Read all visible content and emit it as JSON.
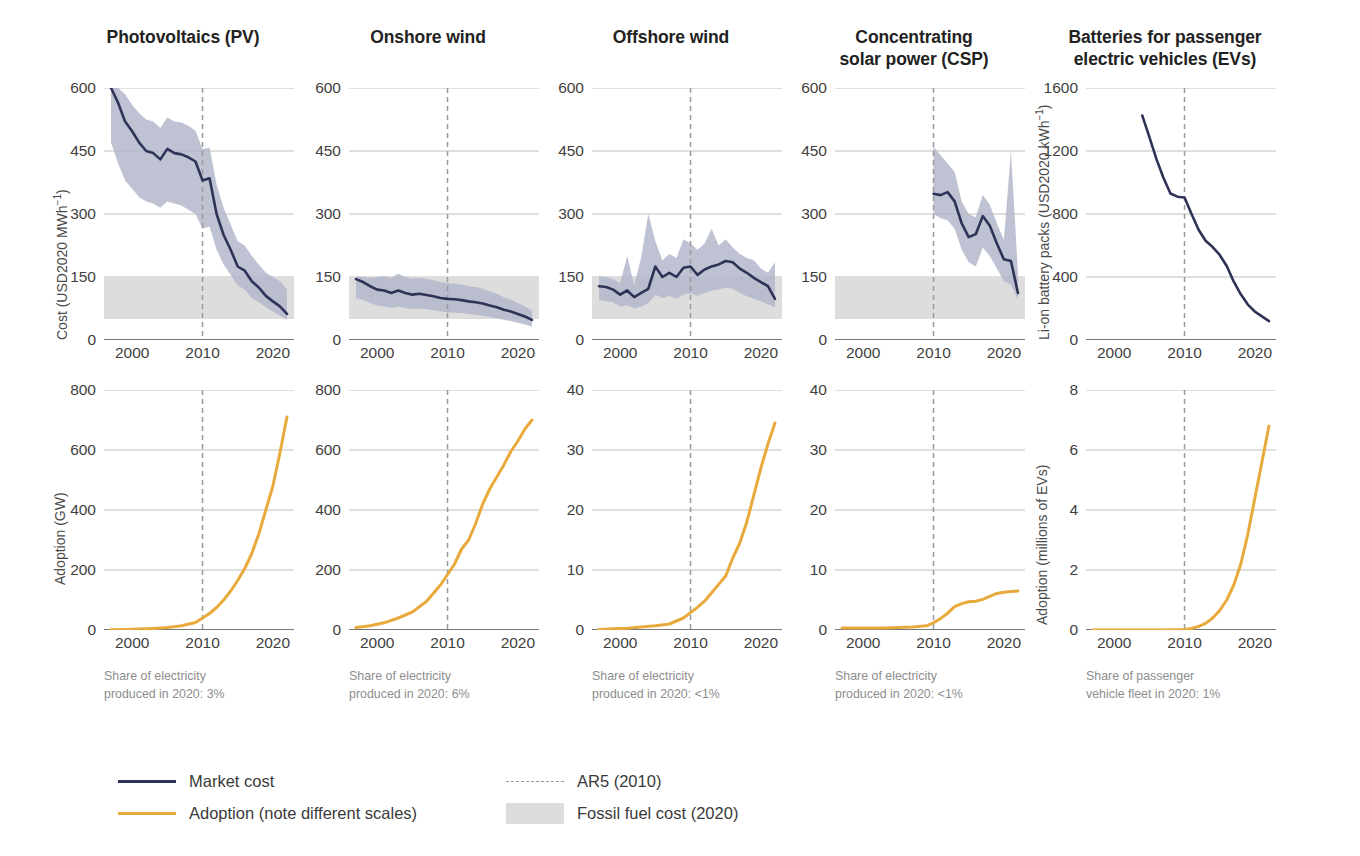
{
  "figure": {
    "legend": {
      "market_cost": "Market cost",
      "adoption": "Adoption (note different scales)",
      "ar5": "AR5 (2010)",
      "fossil": "Fossil fuel cost (2020)"
    },
    "colors": {
      "market_cost_line": "#2e3357",
      "adoption_line": "#e8aa3c",
      "uncertainty_band": "#b3b7cb",
      "fossil_band": "#dddddd",
      "ar5_dashed": "#9a9a9a",
      "axis": "#777777",
      "grid": "#b8b8b8"
    },
    "ar5_year": 2010
  },
  "panels": [
    {
      "id": "pv",
      "title": "Photovoltaics (PV)",
      "note_line1": "Share of electricity",
      "note_line2": "produced in 2020: 3%",
      "cost": {
        "ylabel_html": "Cost (USD2020 MWh<sup>−1</sup>)",
        "yticks": [
          0,
          150,
          300,
          450,
          600
        ],
        "ylim": [
          0,
          600
        ],
        "xlim": [
          1996,
          2023
        ],
        "xticks": [
          2000,
          2010,
          2020
        ],
        "fossil_band": [
          50,
          150
        ],
        "x": [
          1997,
          1998,
          1999,
          2000,
          2001,
          2002,
          2003,
          2004,
          2005,
          2006,
          2007,
          2008,
          2009,
          2010,
          2011,
          2012,
          2013,
          2014,
          2015,
          2016,
          2017,
          2018,
          2019,
          2020,
          2021,
          2022
        ],
        "y": [
          600,
          565,
          520,
          497,
          470,
          450,
          445,
          430,
          455,
          445,
          442,
          435,
          425,
          380,
          385,
          300,
          250,
          215,
          175,
          165,
          140,
          125,
          105,
          92,
          80,
          62
        ],
        "ylow": [
          470,
          420,
          380,
          360,
          340,
          330,
          325,
          315,
          330,
          325,
          320,
          310,
          300,
          265,
          270,
          215,
          180,
          155,
          130,
          120,
          100,
          90,
          78,
          68,
          58,
          48
        ],
        "yhigh": [
          600,
          600,
          585,
          560,
          540,
          525,
          520,
          505,
          530,
          520,
          518,
          510,
          498,
          455,
          458,
          370,
          315,
          275,
          235,
          225,
          200,
          180,
          160,
          150,
          140,
          120
        ]
      },
      "adoption": {
        "ylabel": "Adoption (GW)",
        "yticks": [
          0,
          200,
          400,
          600,
          800
        ],
        "ylim": [
          0,
          800
        ],
        "xlim": [
          1996,
          2023
        ],
        "xticks": [
          2000,
          2010,
          2020
        ],
        "x": [
          1997,
          1999,
          2001,
          2003,
          2005,
          2007,
          2009,
          2010,
          2011,
          2012,
          2013,
          2014,
          2015,
          2016,
          2017,
          2018,
          2019,
          2020,
          2021,
          2022
        ],
        "y": [
          1,
          2,
          3,
          5,
          8,
          14,
          25,
          40,
          55,
          75,
          100,
          130,
          165,
          205,
          255,
          320,
          400,
          480,
          590,
          710
        ]
      }
    },
    {
      "id": "onshore-wind",
      "title": "Onshore wind",
      "note_line1": "Share of electricity",
      "note_line2": "produced in 2020: 6%",
      "cost": {
        "yticks": [
          0,
          150,
          300,
          450,
          600
        ],
        "ylim": [
          0,
          600
        ],
        "xlim": [
          1996,
          2023
        ],
        "xticks": [
          2000,
          2010,
          2020
        ],
        "fossil_band": [
          50,
          150
        ],
        "x": [
          1997,
          1998,
          1999,
          2000,
          2001,
          2002,
          2003,
          2004,
          2005,
          2006,
          2007,
          2008,
          2009,
          2010,
          2011,
          2012,
          2013,
          2014,
          2015,
          2016,
          2017,
          2018,
          2019,
          2020,
          2021,
          2022
        ],
        "y": [
          145,
          138,
          128,
          120,
          118,
          112,
          118,
          112,
          108,
          110,
          107,
          104,
          100,
          98,
          97,
          95,
          92,
          90,
          87,
          82,
          78,
          72,
          68,
          62,
          56,
          48
        ],
        "ylow": [
          100,
          95,
          88,
          82,
          80,
          76,
          80,
          76,
          74,
          75,
          73,
          71,
          68,
          66,
          65,
          64,
          62,
          60,
          58,
          55,
          52,
          48,
          45,
          41,
          37,
          32
        ],
        "yhigh": [
          152,
          150,
          148,
          150,
          152,
          148,
          158,
          150,
          146,
          148,
          146,
          142,
          138,
          136,
          134,
          132,
          128,
          126,
          122,
          116,
          110,
          102,
          96,
          88,
          80,
          70
        ]
      },
      "adoption": {
        "yticks": [
          0,
          200,
          400,
          600,
          800
        ],
        "ylim": [
          0,
          800
        ],
        "xlim": [
          1996,
          2023
        ],
        "xticks": [
          2000,
          2010,
          2020
        ],
        "x": [
          1997,
          1999,
          2001,
          2003,
          2005,
          2007,
          2009,
          2010,
          2011,
          2012,
          2013,
          2014,
          2015,
          2016,
          2017,
          2018,
          2019,
          2020,
          2021,
          2022
        ],
        "y": [
          8,
          14,
          24,
          40,
          60,
          95,
          150,
          185,
          220,
          270,
          300,
          355,
          420,
          470,
          510,
          550,
          595,
          630,
          670,
          700
        ]
      }
    },
    {
      "id": "offshore-wind",
      "title": "Offshore wind",
      "note_line1": "Share of electricity",
      "note_line2": "produced in 2020: <1%",
      "cost": {
        "yticks": [
          0,
          150,
          300,
          450,
          600
        ],
        "ylim": [
          0,
          600
        ],
        "xlim": [
          1996,
          2023
        ],
        "xticks": [
          2000,
          2010,
          2020
        ],
        "fossil_band": [
          50,
          150
        ],
        "x": [
          1997,
          1998,
          1999,
          2000,
          2001,
          2002,
          2003,
          2004,
          2005,
          2006,
          2007,
          2008,
          2009,
          2010,
          2011,
          2012,
          2013,
          2014,
          2015,
          2016,
          2017,
          2018,
          2019,
          2020,
          2021,
          2022
        ],
        "y": [
          128,
          126,
          120,
          108,
          118,
          102,
          112,
          122,
          175,
          150,
          160,
          150,
          172,
          175,
          155,
          168,
          175,
          180,
          188,
          185,
          170,
          160,
          148,
          138,
          128,
          98
        ],
        "ylow": [
          95,
          92,
          90,
          80,
          82,
          75,
          80,
          88,
          108,
          100,
          105,
          98,
          108,
          112,
          105,
          112,
          118,
          120,
          125,
          122,
          112,
          104,
          98,
          92,
          85,
          78
        ],
        "yhigh": [
          152,
          150,
          145,
          135,
          200,
          130,
          198,
          300,
          235,
          190,
          205,
          195,
          240,
          230,
          215,
          230,
          265,
          225,
          240,
          220,
          205,
          195,
          190,
          170,
          160,
          185
        ]
      },
      "adoption": {
        "yticks": [
          0,
          10,
          20,
          30,
          40
        ],
        "ylim": [
          0,
          40
        ],
        "xlim": [
          1996,
          2023
        ],
        "xticks": [
          2000,
          2010,
          2020
        ],
        "x": [
          1997,
          1999,
          2001,
          2003,
          2005,
          2007,
          2009,
          2010,
          2011,
          2012,
          2013,
          2014,
          2015,
          2016,
          2017,
          2018,
          2019,
          2020,
          2021,
          2022
        ],
        "y": [
          0.1,
          0.2,
          0.3,
          0.5,
          0.7,
          1.0,
          2.0,
          2.9,
          3.8,
          4.8,
          6.2,
          7.6,
          9.0,
          12.0,
          14.5,
          18.0,
          22.5,
          27.0,
          31.0,
          34.5
        ]
      }
    },
    {
      "id": "csp",
      "title": "Concentrating\nsolar power (CSP)",
      "note_line1": "Share of electricity",
      "note_line2": "produced in 2020: <1%",
      "cost": {
        "yticks": [
          0,
          150,
          300,
          450,
          600
        ],
        "ylim": [
          0,
          600
        ],
        "xlim": [
          1996,
          2023
        ],
        "xticks": [
          2000,
          2010,
          2020
        ],
        "fossil_band": [
          50,
          150
        ],
        "x": [
          2010,
          2011,
          2012,
          2013,
          2014,
          2015,
          2016,
          2017,
          2018,
          2019,
          2020,
          2021,
          2022
        ],
        "y": [
          348,
          345,
          352,
          330,
          278,
          245,
          252,
          295,
          272,
          230,
          192,
          188,
          112
        ],
        "ylow": [
          300,
          290,
          285,
          265,
          215,
          185,
          175,
          220,
          200,
          170,
          140,
          132,
          95
        ],
        "yhigh": [
          460,
          440,
          420,
          400,
          330,
          300,
          292,
          345,
          322,
          278,
          238,
          450,
          160
        ]
      },
      "adoption": {
        "yticks": [
          0,
          10,
          20,
          30,
          40
        ],
        "ylim": [
          0,
          40
        ],
        "xlim": [
          1996,
          2023
        ],
        "xticks": [
          2000,
          2010,
          2020
        ],
        "x": [
          1997,
          1999,
          2001,
          2003,
          2005,
          2007,
          2009,
          2010,
          2011,
          2012,
          2013,
          2014,
          2015,
          2016,
          2017,
          2018,
          2019,
          2020,
          2021,
          2022
        ],
        "y": [
          0.35,
          0.35,
          0.35,
          0.35,
          0.4,
          0.5,
          0.7,
          1.2,
          1.9,
          2.8,
          3.9,
          4.4,
          4.7,
          4.8,
          5.1,
          5.6,
          6.1,
          6.3,
          6.4,
          6.5
        ]
      }
    },
    {
      "id": "ev-batteries",
      "title": "Batteries for passenger\nelectric vehicles (EVs)",
      "note_line1": "Share of passenger",
      "note_line2": "vehicle fleet in 2020: 1%",
      "cost": {
        "ylabel_html": "Li-on battery packs (USD2020 kWh<sup>−1</sup>)",
        "yticks": [
          0,
          400,
          800,
          1200,
          1600
        ],
        "ylim": [
          0,
          1600
        ],
        "xlim": [
          1996,
          2023
        ],
        "xticks": [
          2000,
          2010,
          2020
        ],
        "fossil_band": null,
        "x": [
          2004,
          2005,
          2006,
          2007,
          2008,
          2009,
          2010,
          2011,
          2012,
          2013,
          2014,
          2015,
          2016,
          2017,
          2018,
          2019,
          2020,
          2021,
          2022
        ],
        "y": [
          1425,
          1290,
          1150,
          1030,
          930,
          910,
          905,
          800,
          700,
          630,
          590,
          540,
          470,
          370,
          290,
          225,
          180,
          150,
          120
        ],
        "ylow": null,
        "yhigh": null
      },
      "adoption": {
        "ylabel": "Adoption (millions of EVs)",
        "yticks": [
          0,
          2,
          4,
          6,
          8
        ],
        "ylim": [
          0,
          8
        ],
        "xlim": [
          1996,
          2023
        ],
        "xticks": [
          2000,
          2010,
          2020
        ],
        "x": [
          1997,
          2000,
          2003,
          2005,
          2007,
          2009,
          2010,
          2011,
          2012,
          2013,
          2014,
          2015,
          2016,
          2017,
          2018,
          2019,
          2020,
          2021,
          2022
        ],
        "y": [
          0.0,
          0.0,
          0.0,
          0.0,
          0.0,
          0.01,
          0.02,
          0.05,
          0.12,
          0.22,
          0.4,
          0.65,
          1.0,
          1.5,
          2.2,
          3.2,
          4.4,
          5.6,
          6.8
        ]
      }
    }
  ]
}
